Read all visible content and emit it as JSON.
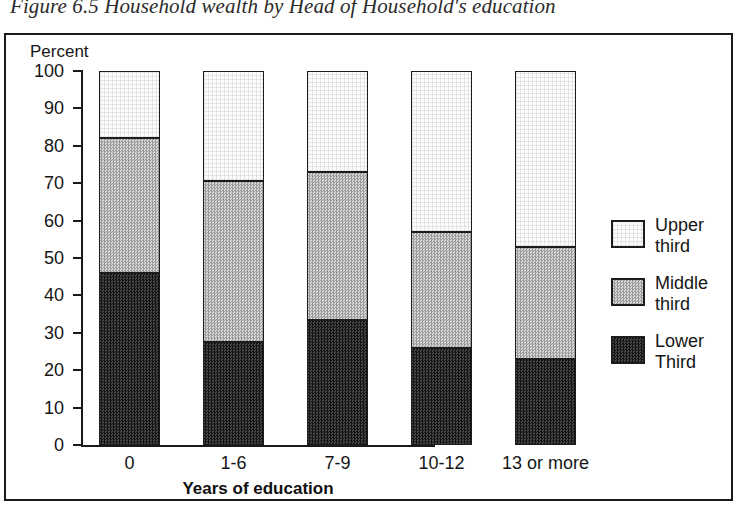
{
  "figure": {
    "caption": "Figure 6.5 Household wealth by Head of Household's education"
  },
  "axes": {
    "y_axis_title": "Percent",
    "x_axis_title": "Years of education"
  },
  "legend": {
    "items": [
      {
        "label_line1": "Upper",
        "label_line2": "third",
        "swatch": "light-swatch"
      },
      {
        "label_line1": "Middle",
        "label_line2": "third",
        "swatch": "medium-swatch"
      },
      {
        "label_line1": "Lower",
        "label_line2": "Third",
        "swatch": "dark-swatch"
      }
    ]
  },
  "chart_data": {
    "type": "bar",
    "stacked": true,
    "title": "Figure 6.5 Household wealth by Head of Household's education",
    "xlabel": "Years of education",
    "ylabel": "Percent",
    "ylim": [
      0,
      100
    ],
    "yticks": [
      0,
      10,
      20,
      30,
      40,
      50,
      60,
      70,
      80,
      90,
      100
    ],
    "ytick_labels": [
      "0",
      "10",
      "20",
      "30",
      "40",
      "50",
      "60",
      "70",
      "80",
      "90",
      "100"
    ],
    "grid": false,
    "legend_position": "right",
    "categories": [
      "0",
      "1-6",
      "7-9",
      "10-12",
      "13 or more"
    ],
    "series": [
      {
        "name": "Lower Third",
        "values": [
          46,
          27.5,
          33.5,
          26,
          23
        ],
        "color": "#2c2c2c"
      },
      {
        "name": "Middle third",
        "values": [
          36,
          43,
          39.5,
          31,
          30
        ],
        "color": "#c3c3c3"
      },
      {
        "name": "Upper third",
        "values": [
          18,
          29.5,
          27,
          43,
          47
        ],
        "color": "#fbfbfb"
      }
    ],
    "cumulative_tops": {
      "lower": [
        46,
        27.5,
        33.5,
        26,
        23
      ],
      "middle": [
        82,
        70.5,
        73,
        57,
        53
      ],
      "upper": [
        100,
        100,
        100,
        100,
        100
      ]
    }
  }
}
